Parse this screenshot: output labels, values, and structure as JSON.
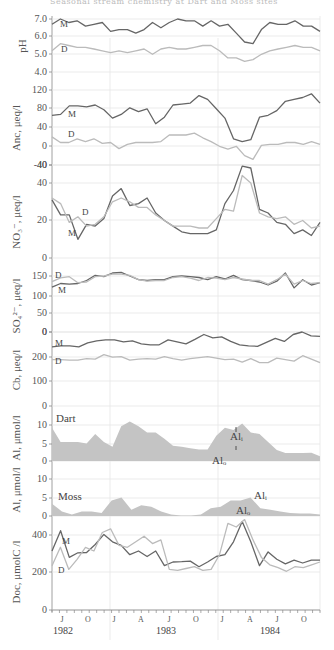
{
  "title": "Seasonal stream chemistry at Dart and Moss sites",
  "colors": {
    "M": "#666666",
    "D": "#bbbbbb",
    "fill": "#c4c4c4",
    "grid": "#e6e6e6",
    "axis": "#888888"
  },
  "x_axis": {
    "months": [
      "J",
      "O",
      "J",
      "A",
      "J",
      "O",
      "J",
      "A",
      "J",
      "O"
    ],
    "years": [
      "1982",
      "1983",
      "1984"
    ]
  },
  "chart_data": [
    {
      "id": "ph",
      "type": "line",
      "ylabel": "pH",
      "ylim": [
        4.0,
        7.0
      ],
      "yticks": [
        "7.0",
        "6.0",
        "5.0",
        "4.0"
      ],
      "series": [
        {
          "name": "M",
          "values": [
            6.7,
            7.0,
            6.8,
            6.9,
            6.6,
            6.7,
            6.8,
            6.3,
            6.4,
            6.4,
            6.2,
            6.4,
            6.8,
            6.5,
            6.8,
            7.0,
            6.9,
            6.9,
            6.6,
            6.9,
            6.6,
            6.7,
            6.2,
            5.7,
            5.6,
            6.4,
            6.8,
            6.7,
            6.7,
            6.9,
            6.6,
            6.6,
            6.3
          ]
        },
        {
          "name": "D",
          "values": [
            5.2,
            5.6,
            5.5,
            5.4,
            5.4,
            5.3,
            5.2,
            5.1,
            5.2,
            5.1,
            5.2,
            5.3,
            5.0,
            5.3,
            5.4,
            5.3,
            5.3,
            5.4,
            5.5,
            5.5,
            5.2,
            4.8,
            4.8,
            4.6,
            4.7,
            5.0,
            5.2,
            5.3,
            5.4,
            5.5,
            5.4,
            5.4,
            5.2
          ]
        }
      ]
    },
    {
      "id": "anc",
      "type": "line",
      "ylabel": "Anc, μeq/l",
      "ylim": [
        -40,
        120
      ],
      "yticks": [
        "120",
        "80",
        "40",
        "0",
        "-40"
      ],
      "series": [
        {
          "name": "M",
          "values": [
            66,
            68,
            86,
            86,
            84,
            88,
            78,
            60,
            68,
            82,
            74,
            80,
            48,
            62,
            88,
            90,
            92,
            108,
            100,
            80,
            60,
            16,
            10,
            14,
            62,
            66,
            76,
            96,
            100,
            104,
            112,
            92
          ]
        },
        {
          "name": "D",
          "values": [
            20,
            8,
            8,
            16,
            10,
            16,
            6,
            8,
            -5,
            4,
            8,
            8,
            8,
            10,
            24,
            24,
            24,
            28,
            18,
            10,
            0,
            -6,
            0,
            -20,
            -28,
            2,
            4,
            4,
            8,
            8,
            4,
            10,
            4
          ]
        }
      ]
    },
    {
      "id": "no3",
      "type": "line",
      "ylabel": "NO₃⁻, μeq/l",
      "ylim": [
        0,
        40
      ],
      "yticks": [
        "40",
        "40",
        "20",
        "0"
      ],
      "series": [
        {
          "name": "M",
          "values": [
            31,
            23,
            23,
            10,
            18,
            17,
            21,
            33,
            37,
            28,
            29,
            32,
            24,
            20,
            17,
            14,
            13,
            13,
            13,
            15,
            29,
            36,
            49,
            48,
            26,
            24,
            19,
            18,
            13,
            15,
            12,
            19
          ]
        },
        {
          "name": "D",
          "values": [
            32,
            29,
            19,
            22,
            17,
            18,
            22,
            30,
            32,
            30,
            27,
            27,
            23,
            20,
            17,
            17,
            17,
            16,
            16,
            21,
            26,
            25,
            44,
            40,
            24,
            22,
            21,
            22,
            18,
            20,
            16,
            17
          ]
        }
      ]
    },
    {
      "id": "so4",
      "type": "line",
      "ylabel": "SO₄²⁻, μeq/l",
      "ylim": [
        0,
        150
      ],
      "yticks": [
        "150",
        "100",
        "50",
        "0"
      ],
      "series": [
        {
          "name": "M",
          "values": [
            120,
            130,
            128,
            130,
            138,
            152,
            148,
            158,
            160,
            150,
            140,
            138,
            140,
            140,
            148,
            150,
            148,
            146,
            140,
            148,
            142,
            152,
            140,
            138,
            134,
            126,
            136,
            158,
            118,
            140,
            126,
            132
          ]
        },
        {
          "name": "D",
          "values": [
            135,
            145,
            148,
            132,
            134,
            148,
            150,
            155,
            155,
            152,
            140,
            136,
            138,
            138,
            146,
            148,
            144,
            138,
            146,
            144,
            140,
            146,
            142,
            138,
            138,
            128,
            140,
            155,
            128,
            138,
            130,
            132
          ]
        }
      ]
    },
    {
      "id": "cb",
      "type": "line",
      "ylabel": "Cb, μeq/l",
      "ylim": [
        0,
        300
      ],
      "yticks": [
        "0",
        "200",
        "100",
        "0"
      ],
      "series": [
        {
          "name": "M",
          "values": [
            240,
            244,
            244,
            240,
            256,
            264,
            268,
            268,
            260,
            264,
            252,
            248,
            248,
            268,
            260,
            252,
            270,
            290,
            276,
            280,
            262,
            248,
            244,
            242,
            258,
            274,
            262,
            290,
            300,
            284,
            282
          ]
        },
        {
          "name": "D",
          "values": [
            188,
            188,
            186,
            186,
            192,
            190,
            208,
            198,
            200,
            186,
            190,
            192,
            190,
            200,
            192,
            186,
            192,
            196,
            200,
            194,
            188,
            190,
            178,
            192,
            176,
            176,
            194,
            188,
            182,
            204,
            190,
            176
          ]
        }
      ]
    },
    {
      "id": "al_dart",
      "type": "area",
      "ylabel": "Al, μmol/l",
      "ylim": [
        0,
        12
      ],
      "yticks": [
        "10",
        "5",
        "0"
      ],
      "label": "Dart",
      "annotations": [
        "Alᵢ",
        "Alₒ"
      ],
      "values": [
        10.5,
        6,
        6,
        6,
        5.5,
        8.5,
        6,
        4.5,
        11,
        12.5,
        11,
        9,
        9,
        7,
        4.8,
        4.5,
        4,
        3.6,
        3.6,
        8,
        10.5,
        9.8,
        11.8,
        9,
        8.5,
        6,
        3.5,
        2.5,
        2.5,
        2.5,
        2.6,
        1.5
      ]
    },
    {
      "id": "al_moss",
      "type": "area",
      "ylabel": "Al, μmol/l",
      "ylim": [
        0,
        12
      ],
      "yticks": [
        "10",
        "5",
        "0"
      ],
      "label": "Moss",
      "annotations": [
        "Alᵢ",
        "Alₒ"
      ],
      "values": [
        4,
        1.5,
        0.5,
        1.5,
        1.5,
        1.0,
        5,
        6,
        2,
        3.5,
        3,
        1.5,
        0.5,
        0.2,
        0.2,
        0.5,
        2.5,
        3,
        5,
        5,
        6,
        2.5,
        2,
        1.5,
        1.0,
        0.8,
        0.8,
        0.5
      ]
    },
    {
      "id": "doc",
      "type": "line",
      "ylabel": "Doc, μmolC /l",
      "ylim": [
        0,
        450
      ],
      "yticks": [
        "400",
        "200",
        "0"
      ],
      "series": [
        {
          "name": "M",
          "values": [
            320,
            430,
            285,
            310,
            312,
            355,
            410,
            370,
            350,
            300,
            320,
            290,
            320,
            240,
            260,
            262,
            265,
            235,
            260,
            290,
            300,
            370,
            480,
            370,
            240,
            315,
            275,
            250,
            270,
            255,
            270,
            270
          ]
        },
        {
          "name": "D",
          "values": [
            240,
            340,
            220,
            275,
            340,
            320,
            420,
            440,
            350,
            340,
            370,
            400,
            360,
            380,
            220,
            215,
            225,
            235,
            215,
            220,
            300,
            470,
            450,
            490,
            380,
            285,
            245,
            230,
            210,
            235,
            230,
            245,
            260
          ]
        }
      ]
    }
  ]
}
